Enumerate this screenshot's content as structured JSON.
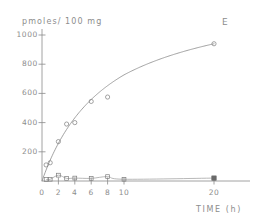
{
  "chart_data": {
    "type": "line",
    "title": "",
    "panel_label": "E",
    "xlabel": "TIME (h)",
    "ylabel": "pmoles/ 100 mg",
    "grid": false,
    "legend_position": "none",
    "x_tick_labels": [
      "0",
      "2",
      "4",
      "6",
      "8",
      "10",
      "20"
    ],
    "x_tick_values": [
      0,
      2,
      4,
      6,
      8,
      10,
      20
    ],
    "y_tick_labels": [
      "200",
      "400",
      "600",
      "800",
      "1000"
    ],
    "y_tick_values": [
      200,
      400,
      600,
      800,
      1000
    ],
    "xlim": [
      0,
      20
    ],
    "ylim": [
      0,
      1060
    ],
    "x_axis_note": "compressed scale between 10 and 20",
    "series": [
      {
        "name": "uptake",
        "marker": "open-circle",
        "fitted_curve": true,
        "x": [
          0.5,
          1.0,
          2.0,
          3.0,
          4.0,
          6.0,
          8.0,
          20.0
        ],
        "values": [
          110,
          125,
          270,
          390,
          400,
          545,
          575,
          940
        ]
      },
      {
        "name": "baseline",
        "marker": "open-square",
        "fitted_curve": false,
        "x": [
          0.5,
          1.0,
          2.0,
          3.0,
          4.0,
          6.0,
          8.0,
          10.0,
          20.0
        ],
        "values": [
          10,
          12,
          40,
          18,
          20,
          18,
          30,
          12,
          20
        ]
      }
    ]
  },
  "axis": {
    "y_title": "pmoles/ 100 mg",
    "x_title": "TIME (h)",
    "panel": "E"
  }
}
